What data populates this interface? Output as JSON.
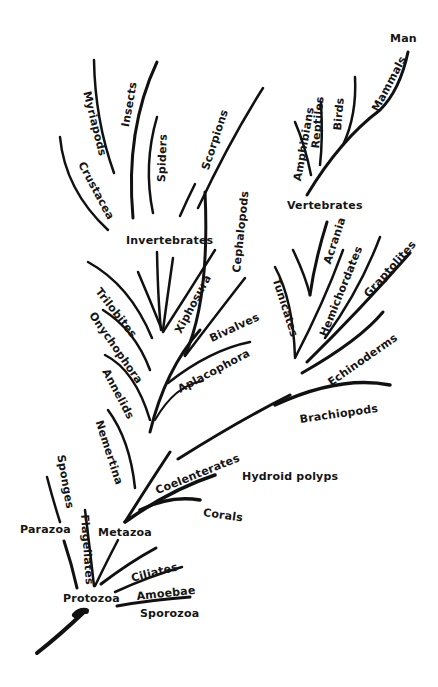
{
  "diagram": {
    "labels": {
      "man": "Man",
      "mammals": "Mammals",
      "birds": "Birds",
      "reptiles": "Reptiles",
      "amphibians": "Amphibians",
      "vertebrates": "Vertebrates",
      "myriapods": "Myriapods",
      "insects": "Insects",
      "crustacea": "Crustacea",
      "spiders": "Spiders",
      "scorpions": "Scorpions",
      "invertebrates": "Invertebrates",
      "cephalopods": "Cephalopods",
      "trilobites": "Trilobites",
      "xiphosura": "Xiphosura",
      "onychophora": "Onychophora",
      "bivalves": "Bivalves",
      "aplacophora": "Aplacophora",
      "annelids": "Annelids",
      "acrania": "Acrania",
      "tunicates": "Tunicates",
      "hemichordates": "Hemichordates",
      "graptolites": "Graptolites",
      "echinoderms": "Echinoderms",
      "brachiopods": "Brachiopods",
      "nemertina": "Nemertina",
      "coelenterates": "Coelenterates",
      "hydroid_polyps": "Hydroid polyps",
      "corals": "Corals",
      "sponges": "Sponges",
      "parazoa": "Parazoa",
      "flagellates": "Flagellates",
      "metazoa": "Metazoa",
      "ciliates": "Ciliates",
      "amoebae": "Amoebae",
      "protozoa": "Protozoa",
      "sporozoa": "Sporozoa"
    },
    "colors": {
      "ink": "#111111",
      "background": "#ffffff"
    }
  }
}
